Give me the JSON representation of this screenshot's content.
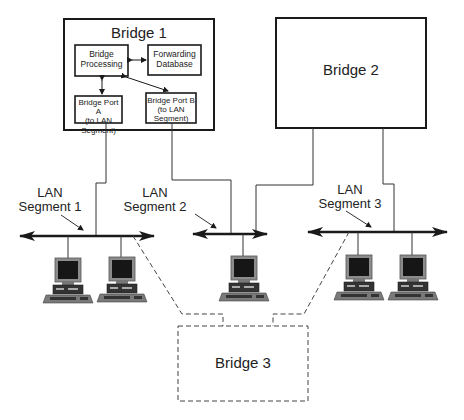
{
  "diagram": {
    "bridges": [
      {
        "id": "bridge1",
        "label": "Bridge 1",
        "style": "solid",
        "components": {
          "processing": "Bridge\nProcessing",
          "database": "Forwarding\nDatabase",
          "port_a": "Bridge Port A\n(to LAN\nSegment)",
          "port_b": "Bridge Port B\n(to LAN\nSegment)"
        }
      },
      {
        "id": "bridge2",
        "label": "Bridge 2",
        "style": "solid"
      },
      {
        "id": "bridge3",
        "label": "Bridge 3",
        "style": "dashed"
      }
    ],
    "segments": [
      {
        "id": "seg1",
        "label": "LAN\nSegment 1",
        "computers": 2
      },
      {
        "id": "seg2",
        "label": "LAN\nSegment 2",
        "computers": 1
      },
      {
        "id": "seg3",
        "label": "LAN\nSegment 3",
        "computers": 2
      }
    ],
    "connections": [
      {
        "from": "bridge1.port_a",
        "to": "seg1"
      },
      {
        "from": "bridge1.port_b",
        "to": "seg2"
      },
      {
        "from": "bridge2",
        "to": "seg2"
      },
      {
        "from": "bridge2",
        "to": "seg3"
      },
      {
        "from": "bridge3",
        "to": "seg1",
        "style": "dashed"
      },
      {
        "from": "bridge3",
        "to": "seg3",
        "style": "dashed"
      }
    ],
    "colors": {
      "line": "#2a2a2a",
      "screen": "#1a1a1a",
      "case": "#8a8a8a"
    }
  }
}
